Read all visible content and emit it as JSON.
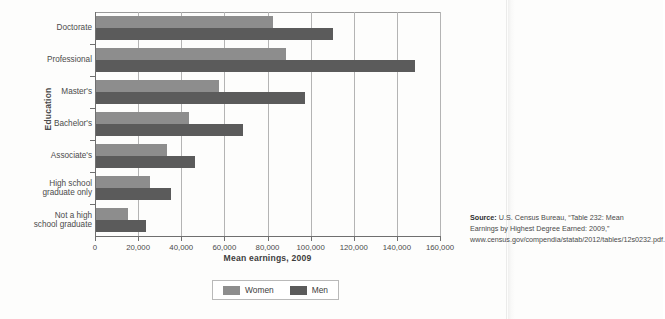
{
  "top_caption": "",
  "chart_data": {
    "type": "bar",
    "orientation": "horizontal",
    "title": "",
    "xlabel": "Mean earnings, 2009",
    "ylabel": "Education",
    "xlim": [
      0,
      160000
    ],
    "xticks": [
      0,
      20000,
      40000,
      60000,
      80000,
      100000,
      120000,
      140000,
      160000
    ],
    "xtick_labels": [
      "0",
      "20,000",
      "40,000",
      "60,000",
      "80,000",
      "100,000",
      "120,000",
      "140,000",
      "160,000"
    ],
    "grid": "vertical",
    "legend_position": "bottom",
    "categories": [
      "Doctorate",
      "Professional",
      "Master's",
      "Bachelor's",
      "Associate's",
      "High school graduate only",
      "Not a high school graduate"
    ],
    "category_labels": [
      [
        "Doctorate"
      ],
      [
        "Professional"
      ],
      [
        "Master's"
      ],
      [
        "Bachelor's"
      ],
      [
        "Associate's"
      ],
      [
        "High school",
        "graduate only"
      ],
      [
        "Not a high",
        "school graduate"
      ]
    ],
    "series": [
      {
        "name": "Women",
        "color": "#8d8d8d",
        "values": [
          82000,
          88000,
          57000,
          43000,
          33000,
          25000,
          15000
        ]
      },
      {
        "name": "Men",
        "color": "#5b5b5b",
        "values": [
          110000,
          148000,
          97000,
          68000,
          46000,
          35000,
          23000
        ]
      }
    ]
  },
  "legend": {
    "items": [
      {
        "label": "Women",
        "color": "#8d8d8d"
      },
      {
        "label": "Men",
        "color": "#5b5b5b"
      }
    ]
  },
  "source_note": {
    "label": "Source:",
    "text": " U.S. Census Bureau, “Table 232: Mean Earnings by Highest Degree Earned: 2009,” www.census.gov/compendia/statab/2012/tables/12s0232.pdf."
  }
}
